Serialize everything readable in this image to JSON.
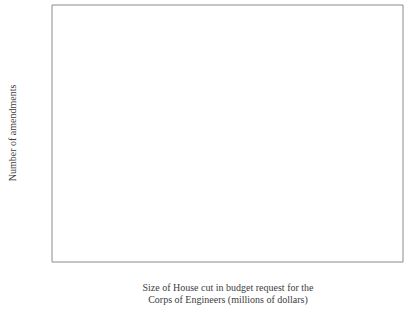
{
  "figure": {
    "background_color": "#ffffff",
    "frame_color": "#8a8a8a",
    "marker_color": "#5d5d5d",
    "line_color": "#5a5a5a",
    "marker_glyph": "✳"
  },
  "chart_data": {
    "type": "scatter",
    "title": "",
    "xlabel_line1": "Size of House cut in budget request for the",
    "xlabel_line2": "Corps of Engineers (millions of dollars)",
    "ylabel": "Number of amendments",
    "xlim": [
      -213,
      96
    ],
    "ylim": [
      -2.0,
      32.0
    ],
    "xticks": [
      -200,
      -150,
      -100,
      -50,
      0,
      50
    ],
    "xtick_labels": [
      "−200",
      "−150",
      "−100",
      "−50",
      "0",
      "50"
    ],
    "yticks": [
      0,
      10,
      20,
      30
    ],
    "ytick_labels": [
      "0",
      "10",
      "20",
      "30"
    ],
    "grid": false,
    "legend": "none",
    "points": [
      {
        "x": -193,
        "y": 23.2,
        "label": "1949"
      },
      {
        "x": -94,
        "y": 28.9,
        "label": "1953"
      },
      {
        "x": -63,
        "y": 22.5,
        "label": "1955"
      },
      {
        "x": -17,
        "y": 16.4,
        "label": ""
      },
      {
        "x": -10,
        "y": 12.5,
        "label": ""
      },
      {
        "x": 1,
        "y": 10.7,
        "label": ""
      },
      {
        "x": -139,
        "y": 8.3,
        "label": ""
      },
      {
        "x": -64,
        "y": 8.4,
        "label": ""
      },
      {
        "x": -12,
        "y": 7.9,
        "label": ""
      },
      {
        "x": -126,
        "y": 6.1,
        "label": ""
      },
      {
        "x": -57,
        "y": 5.9,
        "label": ""
      },
      {
        "x": 28,
        "y": 6.1,
        "label": ""
      },
      {
        "x": -139,
        "y": 4.3,
        "label": ""
      },
      {
        "x": -60,
        "y": 4.0,
        "label": ""
      },
      {
        "x": -47,
        "y": 4.0,
        "label": ""
      },
      {
        "x": -42,
        "y": 2.1,
        "label": ""
      },
      {
        "x": -30,
        "y": 2.1,
        "label": ""
      },
      {
        "x": 16,
        "y": 2.3,
        "label": ""
      },
      {
        "x": -45,
        "y": 0.0,
        "label": ""
      },
      {
        "x": 0,
        "y": 0.0,
        "label": ""
      }
    ],
    "regression_line": {
      "x_start": -213,
      "y_start": 12.9,
      "x_end": 96,
      "y_end": 2.5
    }
  },
  "footer": {
    "partial_text": ""
  }
}
